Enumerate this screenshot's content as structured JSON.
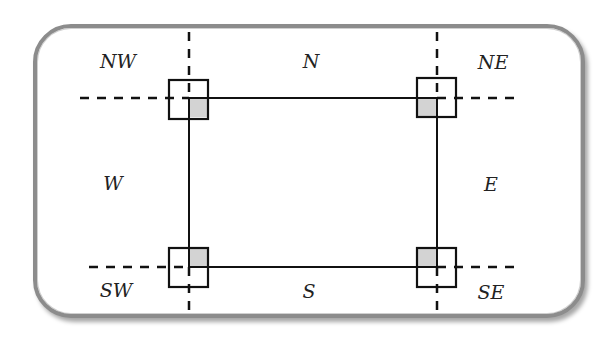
{
  "diagram": {
    "type": "compass-region-diagram",
    "labels": {
      "nw": "NW",
      "n": "N",
      "ne": "NE",
      "w": "W",
      "e": "E",
      "sw": "SW",
      "s": "S",
      "se": "SE"
    },
    "colors": {
      "frame_border": "#8c8c8c",
      "line": "#111111",
      "shaded_quadrant": "#d3d3d3"
    },
    "corners": [
      "top-left",
      "top-right",
      "bottom-left",
      "bottom-right"
    ]
  }
}
